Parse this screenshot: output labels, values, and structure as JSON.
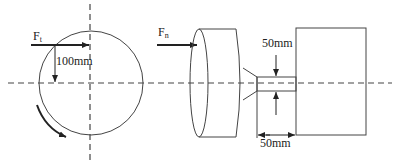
{
  "diagram": {
    "labels": {
      "tangential_force": "F",
      "tangential_force_sub": "t",
      "normal_force": "F",
      "normal_force_sub": "n",
      "radius_dim": "100mm",
      "shaft_diameter_dim": "50mm",
      "shaft_length_dim": "50mm"
    },
    "colors": {
      "stroke": "#333333",
      "background": "#ffffff"
    }
  }
}
